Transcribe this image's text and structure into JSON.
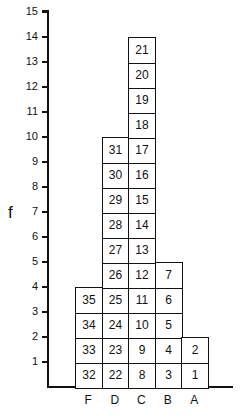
{
  "chart_data": {
    "type": "bar",
    "title": "",
    "xlabel": "",
    "ylabel": "f",
    "ylim": [
      0,
      15
    ],
    "yticks": [
      1,
      2,
      3,
      4,
      5,
      6,
      7,
      8,
      9,
      10,
      11,
      12,
      13,
      14,
      15
    ],
    "grid": false,
    "categories": [
      "F",
      "D",
      "C",
      "B",
      "A"
    ],
    "values": [
      4,
      10,
      14,
      5,
      2
    ],
    "stacked_cell_labels": {
      "F": [
        32,
        33,
        34,
        35
      ],
      "D": [
        22,
        23,
        24,
        25,
        26,
        27,
        28,
        29,
        30,
        31
      ],
      "C": [
        8,
        9,
        10,
        11,
        12,
        13,
        14,
        15,
        16,
        17,
        18,
        19,
        20,
        21
      ],
      "B": [
        3,
        4,
        5,
        6,
        7
      ],
      "A": [
        1,
        2
      ]
    }
  }
}
